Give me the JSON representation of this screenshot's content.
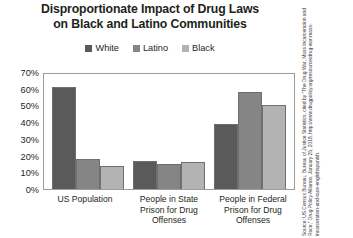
{
  "title": {
    "line1": "Disproportionate Impact of Drug Laws",
    "line2": "on Black and Latino Communities"
  },
  "legend": {
    "position": "top-center",
    "items": [
      {
        "label": "White",
        "color": "#5a5a5a"
      },
      {
        "label": "Latino",
        "color": "#858585"
      },
      {
        "label": "Black",
        "color": "#b3b3b3"
      }
    ]
  },
  "y_axis": {
    "ticks": [
      "70%",
      "60%",
      "50%",
      "40%",
      "30%",
      "20%",
      "10%",
      "0%"
    ],
    "min": 0,
    "max": 70
  },
  "x_axis": {
    "labels": [
      {
        "line1": "US Population",
        "line2": "",
        "line3": ""
      },
      {
        "line1": "People in State",
        "line2": "Prison for Drug",
        "line3": "Offenses"
      },
      {
        "line1": "People in Federal",
        "line2": "Prison for Drug",
        "line3": "Offenses"
      }
    ]
  },
  "source": {
    "text": "Source: US Census Bureau, Bureau of Justice Statistics, cited by \"The Drug War, Mass Incarceration and Race,\" Drug Policy Alliance, January 25, 2018, http://www.drugpolicy.org/resource/drug-war-mass-incarceration-and-race-englishspanish."
  },
  "chart_data": {
    "type": "bar",
    "title": "Disproportionate Impact of Drug Laws on Black and Latino Communities",
    "xlabel": "",
    "ylabel": "",
    "ylim": [
      0,
      70
    ],
    "ytick_labels": [
      "0%",
      "10%",
      "20%",
      "30%",
      "40%",
      "50%",
      "60%",
      "70%"
    ],
    "grid": false,
    "legend_position": "top-center",
    "categories": [
      "US Population",
      "People in State Prison for Drug Offenses",
      "People in Federal Prison for Drug Offenses"
    ],
    "series": [
      {
        "name": "White",
        "color": "#5a5a5a",
        "values": [
          61,
          17,
          39
        ]
      },
      {
        "name": "Latino",
        "color": "#858585",
        "values": [
          18,
          15,
          58
        ]
      },
      {
        "name": "Black",
        "color": "#b3b3b3",
        "values": [
          14,
          16,
          50
        ]
      }
    ],
    "units": "percent"
  }
}
